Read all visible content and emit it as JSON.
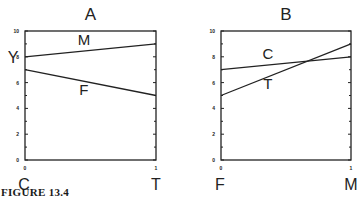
{
  "figure": {
    "caption": "FIGURE 13.4"
  },
  "chart_data": [
    {
      "type": "line",
      "title": "A",
      "xlabel_left": "C",
      "xlabel_right": "T",
      "ylabel": "Y",
      "x": [
        0,
        1
      ],
      "xticks": [
        "0",
        "1"
      ],
      "yticks": [
        "0",
        "2",
        "4",
        "6",
        "8",
        "10"
      ],
      "ylim": [
        0,
        10
      ],
      "xlim": [
        0,
        1
      ],
      "grid": false,
      "series": [
        {
          "name": "M",
          "values": [
            8,
            9
          ]
        },
        {
          "name": "F",
          "values": [
            7,
            5
          ]
        }
      ]
    },
    {
      "type": "line",
      "title": "B",
      "xlabel_left": "F",
      "xlabel_right": "M",
      "ylabel": "",
      "x": [
        0,
        1
      ],
      "xticks": [
        "0",
        "1"
      ],
      "yticks": [
        "0",
        "2",
        "4",
        "6",
        "8",
        "10"
      ],
      "ylim": [
        0,
        10
      ],
      "xlim": [
        0,
        1
      ],
      "grid": false,
      "series": [
        {
          "name": "C",
          "values": [
            7,
            8
          ]
        },
        {
          "name": "T",
          "values": [
            5,
            9
          ]
        }
      ]
    }
  ]
}
